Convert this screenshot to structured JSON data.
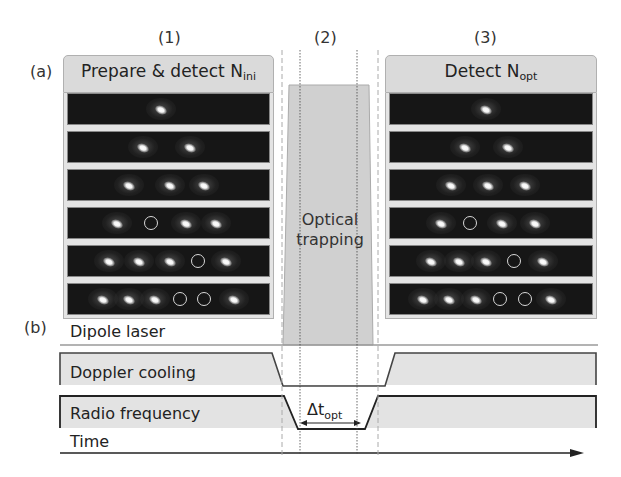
{
  "figure": {
    "panel_a_label": "(a)",
    "panel_b_label": "(b)",
    "stages": [
      {
        "id": "1",
        "label": "(1)"
      },
      {
        "id": "2",
        "label": "(2)"
      },
      {
        "id": "3",
        "label": "(3)"
      }
    ],
    "stage1": {
      "title_main": "Prepare & detect N",
      "title_sub": "ini",
      "frames": [
        {
          "ions": [
            0.46
          ],
          "vacancies": []
        },
        {
          "ions": [
            0.37,
            0.6
          ],
          "vacancies": []
        },
        {
          "ions": [
            0.3,
            0.5,
            0.67
          ],
          "vacancies": []
        },
        {
          "ions": [
            0.24,
            0.58,
            0.73
          ],
          "vacancies": [
            0.41
          ]
        },
        {
          "ions": [
            0.2,
            0.35,
            0.5,
            0.78
          ],
          "vacancies": [
            0.64
          ]
        },
        {
          "ions": [
            0.17,
            0.3,
            0.43,
            0.82
          ],
          "vacancies": [
            0.55,
            0.67
          ]
        }
      ]
    },
    "stage2": {
      "label_line1": "Optical",
      "label_line2": "trapping",
      "fill_color": "#d0d0d0"
    },
    "stage3": {
      "title_main": "Detect N",
      "title_sub": "opt",
      "frames": [
        {
          "ions": [
            0.47
          ],
          "vacancies": []
        },
        {
          "ions": [
            0.37,
            0.58
          ],
          "vacancies": []
        },
        {
          "ions": [
            0.3,
            0.48,
            0.66
          ],
          "vacancies": []
        },
        {
          "ions": [
            0.25,
            0.55,
            0.71
          ],
          "vacancies": [
            0.39
          ]
        },
        {
          "ions": [
            0.2,
            0.34,
            0.47,
            0.75
          ],
          "vacancies": [
            0.61
          ]
        },
        {
          "ions": [
            0.16,
            0.29,
            0.42,
            0.79
          ],
          "vacancies": [
            0.54,
            0.66
          ]
        }
      ]
    },
    "timing": {
      "traces": [
        {
          "name": "dipole-laser",
          "label": "Dipole laser"
        },
        {
          "name": "doppler-cooling",
          "label": "Doppler cooling"
        },
        {
          "name": "radio-frequency",
          "label": "Radio frequency"
        }
      ],
      "delta_label": "Δt",
      "delta_sub": "opt",
      "time_label": "Time"
    },
    "colors": {
      "trace_fill": "#e3e3e3",
      "trace_line": "#333333",
      "laser_fill": "#d0d0d0",
      "frame_bg": "#161616"
    }
  }
}
